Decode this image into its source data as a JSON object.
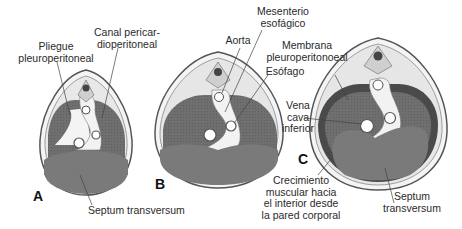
{
  "figure": {
    "panels": [
      {
        "letter": "A"
      },
      {
        "letter": "B"
      },
      {
        "letter": "C"
      }
    ],
    "labels": {
      "pliegue_line1": "Pliegue",
      "pliegue_line2": "pleuroperitoneal",
      "canal_line1": "Canal pericar-",
      "canal_line2": "dioperitoneal",
      "septum_a": "Septum transversum",
      "aorta": "Aorta",
      "mesenterio_line1": "Mesenterio",
      "mesenterio_line2": "esofágico",
      "membrana_line1": "Membrana",
      "membrana_line2": "pleuroperitonoeal",
      "esofago": "Esófago",
      "vena_line1": "Vena",
      "vena_line2": "cava",
      "vena_line3": "inferior",
      "crecimiento_line1": "Crecimiento",
      "crecimiento_line2": "muscular hacia",
      "crecimiento_line3": "el interior desde",
      "crecimiento_line4": "la pared corporal",
      "septum_c_line1": "Septum",
      "septum_c_line2": "transversum"
    }
  }
}
